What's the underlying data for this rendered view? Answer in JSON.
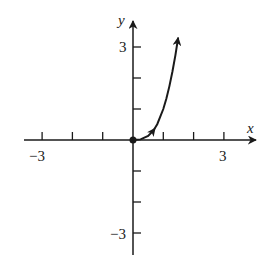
{
  "chart_data": {
    "type": "line",
    "title": "",
    "xlabel": "x",
    "ylabel": "y",
    "xlim": [
      -3.5,
      4.1
    ],
    "ylim": [
      -3.7,
      3.8
    ],
    "grid": false,
    "legend": null,
    "x_ticks": [
      -3,
      -2,
      -1,
      1,
      2,
      3
    ],
    "y_ticks": [
      -3,
      -2,
      -1,
      1,
      2,
      3
    ],
    "x_tick_labels": [
      {
        "value": -3,
        "label": "−3"
      },
      {
        "value": 3,
        "label": "3"
      }
    ],
    "y_tick_labels": [
      {
        "value": 3,
        "label": "3"
      },
      {
        "value": -3,
        "label": "−3"
      }
    ],
    "series": [
      {
        "name": "curve",
        "description": "curve starting at origin (closed dot) and increasing steeply to the right, with direction arrows",
        "start_point": {
          "x": 0,
          "y": 0,
          "marker": "closed-dot"
        },
        "x": [
          0,
          0.25,
          0.5,
          0.67,
          0.8,
          1.0,
          1.1,
          1.2,
          1.3,
          1.4,
          1.49
        ],
        "y": [
          0,
          0.02,
          0.13,
          0.3,
          0.51,
          1.0,
          1.33,
          1.73,
          2.2,
          2.74,
          3.3
        ],
        "mid_arrow_at_x": 0.67,
        "end_arrow": true
      }
    ],
    "annotations": []
  },
  "axes": {
    "x_label": "x",
    "y_label": "y",
    "x_min_label": "−3",
    "x_max_label": "3",
    "y_max_label": "3",
    "y_min_label": "−3"
  }
}
